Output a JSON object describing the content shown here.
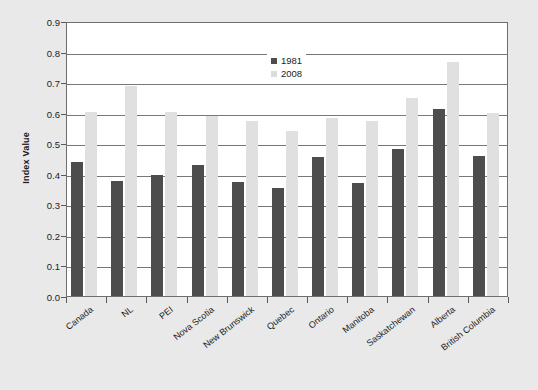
{
  "chart_data": {
    "type": "bar",
    "title": "",
    "xlabel": "",
    "ylabel": "Index Value",
    "ylim": [
      0.0,
      0.9
    ],
    "ytick_labels": [
      "0.9",
      "0.8",
      "0.7",
      "0.6",
      "0.5",
      "0.4",
      "0.3",
      "0.2",
      "0.1",
      "0.0"
    ],
    "yticks": [
      0.9,
      0.8,
      0.7,
      0.6,
      0.5,
      0.4,
      0.3,
      0.2,
      0.1,
      0.0
    ],
    "grid": true,
    "legend_position": "top-center",
    "categories": [
      "Canada",
      "NL",
      "PEI",
      "Nova Scotia",
      "New Brunswick",
      "Quebec",
      "Ontario",
      "Manitoba",
      "Saskatchewan",
      "Alberta",
      "British Columbia"
    ],
    "series": [
      {
        "name": "1981",
        "color": "#4d4d4d",
        "values": [
          0.44,
          0.375,
          0.395,
          0.43,
          0.372,
          0.355,
          0.455,
          0.37,
          0.48,
          0.613,
          0.458
        ]
      },
      {
        "name": "2008",
        "color": "#e0e0e0",
        "values": [
          0.603,
          0.688,
          0.603,
          0.588,
          0.572,
          0.54,
          0.582,
          0.572,
          0.648,
          0.765,
          0.6
        ]
      }
    ]
  },
  "colors": {
    "background": "#e9e9e9",
    "plot_background": "#ffffff",
    "axis": "#6e6e6e",
    "gridline": "#777777",
    "series_1981": "#4d4d4d",
    "series_2008": "#e0e0e0"
  }
}
